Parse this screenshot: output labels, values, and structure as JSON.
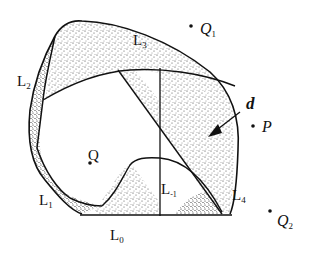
{
  "figure": {
    "labels": {
      "L3": {
        "main": "L",
        "sub": "3"
      },
      "L2": {
        "main": "L",
        "sub": "2"
      },
      "L1": {
        "main": "L",
        "sub": "1"
      },
      "L0": {
        "main": "L",
        "sub": "0"
      },
      "Lm1": {
        "main": "L",
        "sub": "-1"
      },
      "L4": {
        "main": "L",
        "sub": "4"
      },
      "Q1": {
        "main": "Q",
        "sub": "1"
      },
      "Q2": {
        "main": "Q",
        "sub": "2"
      },
      "P": {
        "main": "P"
      },
      "Q": {
        "main": "Q"
      },
      "d": {
        "main": "d"
      }
    },
    "colors": {
      "stroke": "#111111",
      "stipple": "#222222",
      "background": "#ffffff"
    }
  }
}
